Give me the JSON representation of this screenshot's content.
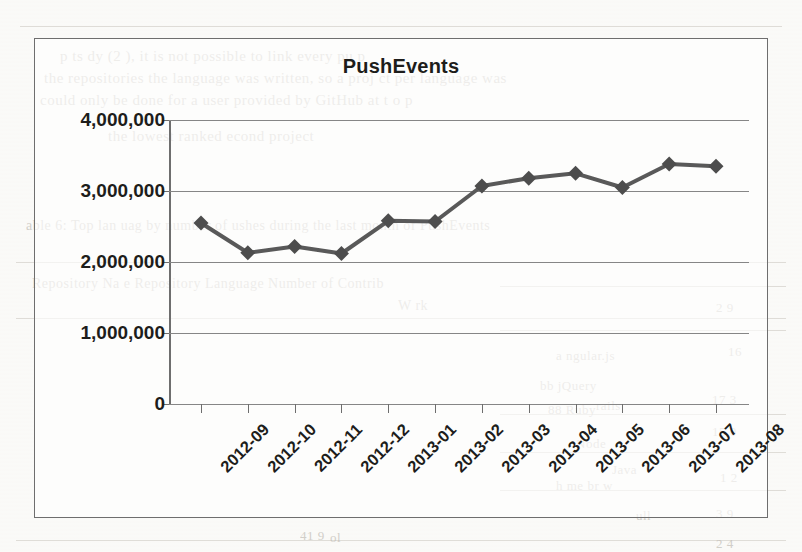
{
  "chart_data": {
    "type": "line",
    "title": "PushEvents",
    "xlabel": "",
    "ylabel": "",
    "categories": [
      "2012-09",
      "2012-10",
      "2012-11",
      "2012-12",
      "2013-01",
      "2013-02",
      "2013-03",
      "2013-04",
      "2013-05",
      "2013-06",
      "2013-07",
      "2013-08"
    ],
    "values": [
      2550000,
      2130000,
      2220000,
      2120000,
      2580000,
      2570000,
      3070000,
      3180000,
      3250000,
      3050000,
      3380000,
      3350000
    ],
    "series": [
      {
        "name": "PushEvents",
        "values": [
          2550000,
          2130000,
          2220000,
          2120000,
          2580000,
          2570000,
          3070000,
          3180000,
          3250000,
          3050000,
          3380000,
          3350000
        ]
      }
    ],
    "ylim": [
      0,
      4000000
    ],
    "ytick_values": [
      0,
      1000000,
      2000000,
      3000000,
      4000000
    ],
    "ytick_labels": [
      "0",
      "1,000,000",
      "2,000,000",
      "3,000,000",
      "4,000,000"
    ],
    "grid": true,
    "legend": "none",
    "marker": "diamond",
    "line_color": "#595959",
    "marker_color": "#4d4d4d",
    "grid_color": "#868686",
    "axis_color": "#6e6e6e",
    "xlabel_rotation": -45
  },
  "page_background": {
    "bleed_lines": [
      {
        "text": "p          ts  dy  (2          ),  it is  not  possible  to     link  every  pu  p",
        "x": 60,
        "y": 48,
        "size": 15
      },
      {
        "text": "the   repositories the   language    was  written, so  a  proj   ct per language  was",
        "x": 44,
        "y": 70,
        "size": 15
      },
      {
        "text": "could   only   be  done   for  a  user  provided  by  GitHub   at  t   o  p",
        "x": 40,
        "y": 92,
        "size": 15
      },
      {
        "text": "the   lowest   ranked     econd  project",
        "x": 108,
        "y": 128,
        "size": 15
      },
      {
        "text": "able  6:  Top  lan   uag   by   number  of    ushes   during  the  last   month  of  PushEvents",
        "x": 26,
        "y": 218,
        "size": 14
      },
      {
        "text": "Repository  Na   e                  Repository  Language        Number  of  Contrib",
        "x": 32,
        "y": 276,
        "size": 14
      },
      {
        "text": "W  rk",
        "x": 398,
        "y": 298,
        "size": 14
      },
      {
        "text": "a  ngular.js",
        "x": 556,
        "y": 348,
        "size": 13
      },
      {
        "text": "bb  jQuery",
        "x": 540,
        "y": 378,
        "size": 13
      },
      {
        "text": "88   Ruby",
        "x": 548,
        "y": 402,
        "size": 13
      },
      {
        "text": "rails",
        "x": 596,
        "y": 398,
        "size": 13
      },
      {
        "text": "Node",
        "x": 576,
        "y": 436,
        "size": 13
      },
      {
        "text": "Java",
        "x": 612,
        "y": 462,
        "size": 13
      },
      {
        "text": "h  me   br  w",
        "x": 556,
        "y": 478,
        "size": 13
      },
      {
        "text": "2  9",
        "x": 716,
        "y": 300,
        "size": 13
      },
      {
        "text": "16",
        "x": 728,
        "y": 344,
        "size": 13
      },
      {
        "text": "17   3",
        "x": 712,
        "y": 392,
        "size": 13
      },
      {
        "text": "15   0",
        "x": 712,
        "y": 424,
        "size": 13
      },
      {
        "text": "1   2",
        "x": 720,
        "y": 470,
        "size": 13
      },
      {
        "text": "3  9",
        "x": 716,
        "y": 506,
        "size": 13
      },
      {
        "text": "2  4",
        "x": 716,
        "y": 536,
        "size": 13
      },
      {
        "text": "ull",
        "x": 636,
        "y": 508,
        "size": 13
      },
      {
        "text": "ol",
        "x": 330,
        "y": 530,
        "size": 13
      },
      {
        "text": "41   9",
        "x": 300,
        "y": 528,
        "size": 13
      }
    ]
  }
}
